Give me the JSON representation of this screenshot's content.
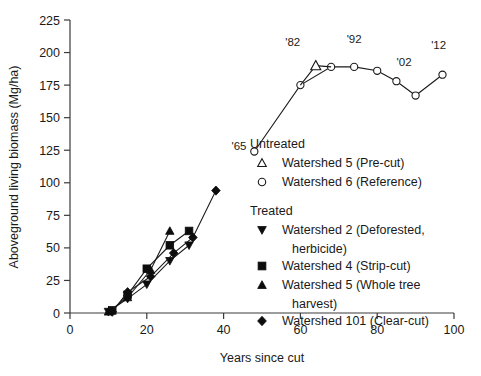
{
  "chart_data": {
    "type": "line",
    "title": "",
    "xlabel": "Years since cut",
    "ylabel": "Aboveground living biomass (Mg/ha)",
    "xlim": [
      0,
      100
    ],
    "ylim": [
      0,
      225
    ],
    "xticks": [
      0,
      20,
      40,
      60,
      80,
      100
    ],
    "yticks": [
      0,
      25,
      50,
      75,
      100,
      125,
      150,
      175,
      200,
      225
    ],
    "grid": false,
    "legend_position": "inside-center-right",
    "series": [
      {
        "name": "Watershed 6 (Reference)",
        "group": "Untreated",
        "marker": "open-circle",
        "x": [
          48,
          60,
          68,
          74,
          80,
          85,
          90,
          97
        ],
        "y": [
          124,
          175,
          189,
          189,
          186,
          178,
          167,
          183
        ]
      },
      {
        "name": "Watershed 5 (Pre-cut)",
        "group": "Untreated",
        "marker": "open-triangle",
        "x": [
          64
        ],
        "y": [
          190
        ]
      },
      {
        "name": "Watershed 2 (Deforested, herbicide)",
        "group": "Treated",
        "marker": "filled-down-triangle",
        "x": [
          10,
          15,
          20,
          26,
          31
        ],
        "y": [
          1,
          11,
          22,
          40,
          52
        ]
      },
      {
        "name": "Watershed 4 (Strip-cut)",
        "group": "Treated",
        "marker": "filled-square",
        "x": [
          11,
          15,
          20,
          26,
          31
        ],
        "y": [
          2,
          14,
          34,
          52,
          63
        ]
      },
      {
        "name": "Watershed 5 (Whole tree harvest)",
        "group": "Treated",
        "marker": "filled-up-triangle",
        "x": [
          10,
          15,
          21,
          26
        ],
        "y": [
          1,
          12,
          33,
          63
        ]
      },
      {
        "name": "Watershed 101 (Clear-cut)",
        "group": "Treated",
        "marker": "filled-diamond",
        "x": [
          11,
          15,
          21,
          27,
          32,
          38
        ],
        "y": [
          1,
          16,
          28,
          46,
          58,
          94
        ]
      }
    ],
    "annotations": [
      {
        "text": "'65",
        "x": 44,
        "y": 125
      },
      {
        "text": "'82",
        "x": 58,
        "y": 205
      },
      {
        "text": "'92",
        "x": 74,
        "y": 207
      },
      {
        "text": "'02",
        "x": 87,
        "y": 190
      },
      {
        "text": "'12",
        "x": 96,
        "y": 203
      }
    ]
  },
  "legend": {
    "groups": [
      {
        "heading": "Untreated",
        "items": [
          {
            "marker": "open-triangle",
            "label": "Watershed 5 (Pre-cut)"
          },
          {
            "marker": "open-circle",
            "label": "Watershed 6 (Reference)"
          }
        ]
      },
      {
        "heading": "Treated",
        "items": [
          {
            "marker": "filled-down-triangle",
            "label": "Watershed 2 (Deforested,"
          },
          {
            "marker": "",
            "label": "herbicide)"
          },
          {
            "marker": "filled-square",
            "label": "Watershed 4 (Strip-cut)"
          },
          {
            "marker": "filled-up-triangle",
            "label": "Watershed 5 (Whole tree"
          },
          {
            "marker": "",
            "label": "harvest)"
          },
          {
            "marker": "filled-diamond",
            "label": "Watershed 101 (Clear-cut)"
          }
        ]
      }
    ]
  },
  "colors": {
    "ink": "#1a1a1a",
    "axis": "#3a3a3a",
    "marker_fill": "#0d0d0d",
    "background": "#ffffff"
  }
}
